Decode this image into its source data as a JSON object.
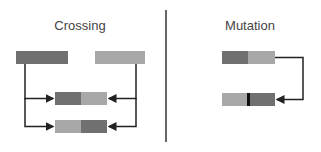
{
  "crossing": {
    "title": "Crossing",
    "parents": [
      {
        "name": "parent-1",
        "color": "#707070"
      },
      {
        "name": "parent-2",
        "color": "#a8a8a8"
      }
    ],
    "offspring": [
      {
        "name": "offspring-1",
        "segments": [
          "#707070",
          "#a8a8a8"
        ]
      },
      {
        "name": "offspring-2",
        "segments": [
          "#a8a8a8",
          "#707070"
        ]
      }
    ]
  },
  "mutation": {
    "title": "Mutation",
    "original": {
      "segments": [
        "#707070",
        "#a8a8a8"
      ]
    },
    "mutated": {
      "segments": [
        "#a8a8a8",
        "#707070"
      ],
      "marker_color": "#111111"
    }
  },
  "colors": {
    "dark": "#707070",
    "light": "#a8a8a8",
    "line": "#222222",
    "divider": "#333333"
  }
}
